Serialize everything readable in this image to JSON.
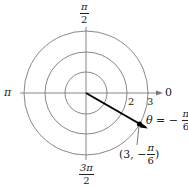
{
  "diagram": {
    "type": "polar-coordinate-plot",
    "center": {
      "x": 86,
      "y": 93
    },
    "circles": [
      {
        "r_value": 1,
        "r_px": 21
      },
      {
        "r_value": 2,
        "r_px": 41
      },
      {
        "r_value": 3,
        "r_px": 62
      }
    ],
    "angle_labels": {
      "top": {
        "num": "π",
        "den": "2"
      },
      "left": "π",
      "right": "0",
      "bottom": {
        "num": "3π",
        "den": "2"
      }
    },
    "radius_labels": [
      "2",
      "3"
    ],
    "ray": {
      "theta_label": "θ = −",
      "theta_num": "π",
      "theta_den": "6"
    },
    "point": {
      "label_prefix": "(3, −",
      "label_num": "π",
      "label_den": "6",
      "label_suffix": ")",
      "r": 3,
      "theta": "-π/6"
    },
    "colors": {
      "circle": "#777777",
      "axis": "#777777",
      "ray": "#000000",
      "point": "#000000"
    }
  }
}
